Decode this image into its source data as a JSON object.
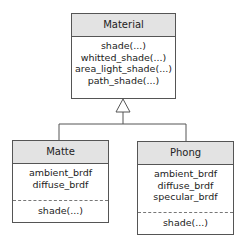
{
  "diagram": {
    "type": "uml-class-inheritance",
    "classes": [
      {
        "id": "material",
        "name": "Material",
        "attributes": [],
        "methods": [
          "shade(...)",
          "whitted_shade(...)",
          "area_light_shade(...)",
          "path_shade(...)"
        ]
      },
      {
        "id": "matte",
        "name": "Matte",
        "attributes": [
          "ambient_brdf",
          "diffuse_brdf"
        ],
        "methods": [
          "shade(...)"
        ]
      },
      {
        "id": "phong",
        "name": "Phong",
        "attributes": [
          "ambient_brdf",
          "diffuse_brdf",
          "specular_brdf"
        ],
        "methods": [
          "shade(...)"
        ]
      }
    ],
    "relations": [
      {
        "type": "generalization",
        "from": "matte",
        "to": "material"
      },
      {
        "type": "generalization",
        "from": "phong",
        "to": "material"
      }
    ],
    "colors": {
      "header_fill": "#e3e3e3",
      "border": "#555555",
      "background": "#ffffff"
    }
  }
}
